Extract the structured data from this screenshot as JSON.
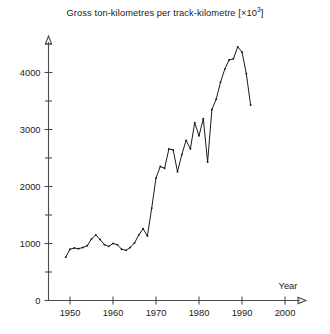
{
  "chart_data": {
    "type": "line",
    "title_main": "Gross ton-kilometres per track-kilometre [×10",
    "title_sup": "3",
    "title_tail": "]",
    "xlabel": "Year",
    "ylabel": "",
    "xlim": [
      1945,
      2003
    ],
    "ylim": [
      0,
      4700
    ],
    "grid": false,
    "legend": null,
    "line_color": "#1a1a1a",
    "axis_color": "#4d4d4d",
    "x_ticks": [
      1950,
      1960,
      1970,
      1980,
      1990,
      2000
    ],
    "x_tick_labels": [
      "1950",
      "1960",
      "1970",
      "1980",
      "1990",
      "2000"
    ],
    "y_ticks": [
      0,
      1000,
      2000,
      3000,
      4000
    ],
    "y_tick_labels": [
      "0",
      "1000",
      "2000",
      "3000",
      "4000"
    ],
    "y_minor_ticks": [
      500,
      1500,
      2500,
      3500,
      4500
    ],
    "x": [
      1949,
      1950,
      1951,
      1952,
      1953,
      1954,
      1955,
      1956,
      1957,
      1958,
      1959,
      1960,
      1961,
      1962,
      1963,
      1964,
      1965,
      1966,
      1967,
      1968,
      1969,
      1970,
      1971,
      1972,
      1973,
      1974,
      1975,
      1976,
      1977,
      1978,
      1979,
      1980,
      1981,
      1982,
      1983,
      1984,
      1985,
      1986,
      1987,
      1988,
      1989,
      1990,
      1991,
      1992
    ],
    "values": [
      760,
      900,
      920,
      910,
      930,
      960,
      1080,
      1150,
      1070,
      980,
      950,
      1000,
      980,
      900,
      880,
      930,
      1010,
      1150,
      1260,
      1130,
      1620,
      2150,
      2350,
      2320,
      2660,
      2640,
      2260,
      2560,
      2810,
      2660,
      3120,
      2890,
      3190,
      2430,
      3350,
      3530,
      3830,
      4060,
      4220,
      4240,
      4450,
      4360,
      3980,
      3430
    ],
    "series_name": "Gross ton-kilometres per track-kilometre",
    "annotations": []
  }
}
